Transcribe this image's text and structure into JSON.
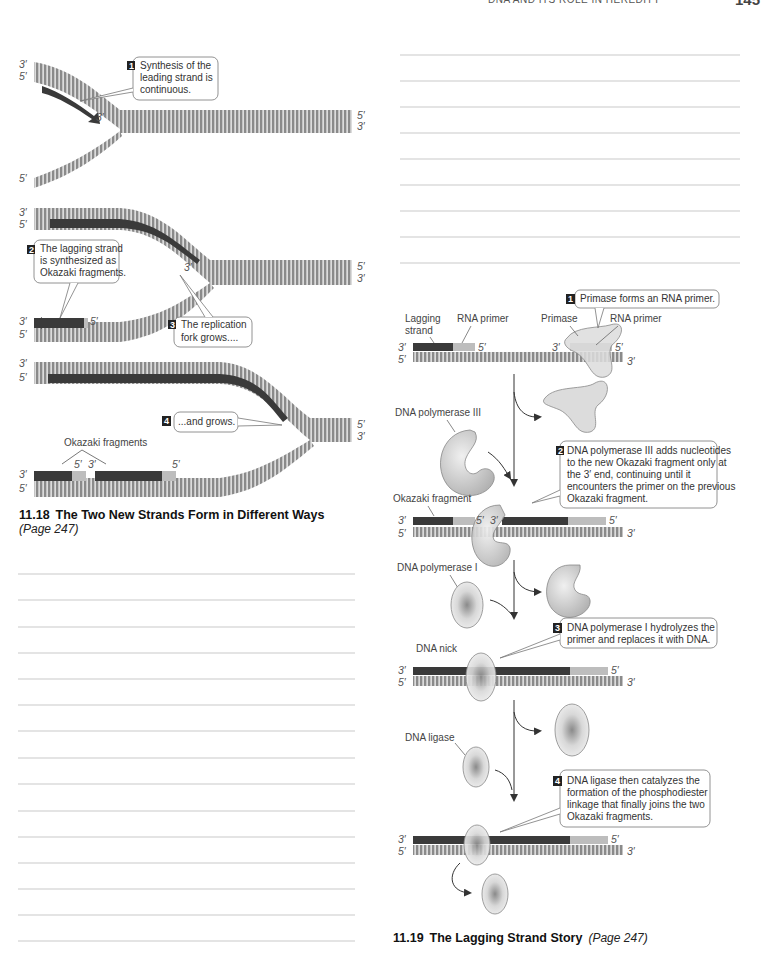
{
  "header": {
    "running_head": "DNA AND ITS ROLE IN HEREDITY",
    "page_number": "145"
  },
  "figure_11_18": {
    "number": "11.18",
    "title": "The Two New Strands Form in Different Ways",
    "page_ref": "(Page 247)",
    "panels": [
      {
        "step": "1",
        "callout": [
          "Synthesis of the",
          "leading strand is",
          "continuous."
        ],
        "end_labels": {
          "top_left_upper": "3′",
          "top_left_lower": "5′",
          "new_strand_end": "3′",
          "right_upper": "5′",
          "right_lower": "3′",
          "bottom_left": "5′"
        }
      },
      {
        "step": "2",
        "callout": [
          "The lagging strand",
          "is synthesized as",
          "Okazaki fragments."
        ],
        "step3": "3",
        "callout3": [
          "The replication",
          "fork grows...."
        ],
        "end_labels": {
          "top_left_upper": "3′",
          "top_left_lower": "5′",
          "new_strand_end": "3′",
          "right_upper": "5′",
          "right_lower": "3′",
          "bottom_left_upper": "3′",
          "bottom_left_lower": "5′",
          "fragment_end": "5′"
        }
      },
      {
        "step": "4",
        "callout": [
          "...and grows."
        ],
        "okazaki_label": "Okazaki fragments",
        "end_labels": {
          "top_left_upper": "3′",
          "top_left_lower": "5′",
          "right_upper": "5′",
          "right_lower": "3′",
          "bottom_left_upper": "3′",
          "bottom_left_lower": "5′",
          "frag_5": "5′",
          "frag_3": "3′",
          "frag2_5": "5′"
        }
      }
    ],
    "answer_lines": 15
  },
  "figure_11_19": {
    "number": "11.19",
    "title": "The Lagging Strand Story",
    "page_ref": "(Page 247)",
    "answer_lines": 9,
    "labels": {
      "lagging_strand": [
        "Lagging",
        "strand"
      ],
      "rna_primer": "RNA primer",
      "primase": "Primase",
      "rna_primer_2": "RNA primer",
      "dna_pol_3": "DNA polymerase III",
      "okazaki_fragment": "Okazaki fragment",
      "dna_pol_1": "DNA polymerase I",
      "dna_nick": "DNA nick",
      "dna_ligase": "DNA ligase",
      "p3": "3′",
      "p5": "5′"
    },
    "steps": [
      {
        "num": "1",
        "lines": [
          "Primase forms an RNA primer."
        ]
      },
      {
        "num": "2",
        "lines": [
          "DNA polymerase III adds nucleotides",
          "to the new Okazaki fragment only at",
          "the 3′ end, continuing until it",
          "encounters the primer on the previous",
          "Okazaki fragment."
        ]
      },
      {
        "num": "3",
        "lines": [
          "DNA polymerase I hydrolyzes the",
          "primer and replaces it with DNA."
        ]
      },
      {
        "num": "4",
        "lines": [
          "DNA ligase then catalyzes the",
          "formation of the phosphodiester",
          "linkage that finally joins the two",
          "Okazaki fragments."
        ]
      }
    ]
  },
  "colors": {
    "parent_strand": "#8a8a8a",
    "new_strand_dark": "#3a3a3a",
    "primer_light": "#bdbdbd",
    "enzyme_fill": "#d4d4d4",
    "rule_line": "#c9c9c9"
  }
}
